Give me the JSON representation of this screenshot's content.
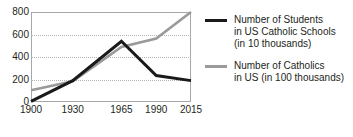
{
  "chart_data": {
    "type": "line",
    "title": "",
    "xlabel": "",
    "ylabel": "",
    "x": [
      1900,
      1930,
      1965,
      1990,
      2015
    ],
    "categories": [
      "1900",
      "1930",
      "1965",
      "1990",
      "2015"
    ],
    "xlim": [
      1900,
      2015
    ],
    "ylim": [
      0,
      800
    ],
    "yticks": [
      0,
      200,
      400,
      600,
      800
    ],
    "ytick_labels": [
      "0",
      "200",
      "400",
      "600",
      "800"
    ],
    "xtick_labels": [
      "1900",
      "1930",
      "1965",
      "1990",
      "2015"
    ],
    "grid": "horizontal-dotted",
    "legend_position": "right",
    "series": [
      {
        "name": "students",
        "legend_lines": [
          "Number of Students",
          "in US Catholic Schools",
          "(in 10 thousands)"
        ],
        "color": "#1a1a1a",
        "width": 3,
        "values": [
          5,
          190,
          540,
          235,
          190
        ]
      },
      {
        "name": "catholics",
        "legend_lines": [
          "Number of Catholics",
          "in US (in 100 thousands)"
        ],
        "color": "#9a9a9a",
        "width": 2.6,
        "values": [
          105,
          185,
          490,
          565,
          800
        ]
      }
    ]
  },
  "colors": {
    "background": "#ffffff",
    "axis": "#a7a7a7",
    "grid": "#b4b4b4",
    "text": "#231f20",
    "series_students": "#1a1a1a",
    "series_catholics": "#9a9a9a"
  }
}
